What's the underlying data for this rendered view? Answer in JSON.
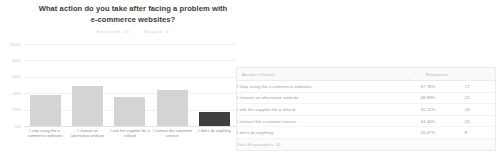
{
  "chart_data": {
    "type": "bar",
    "title": "What action do you take after facing a problem with e-commerce websites?",
    "subtitle": {
      "answered_label": "Answered: 45",
      "skipped_label": "Skipped: 0"
    },
    "xlabel": "",
    "ylabel": "",
    "ylim": [
      0,
      100
    ],
    "grid": true,
    "legend": "none",
    "ytick_labels": [
      "100%",
      "80%",
      "60%",
      "40%",
      "20%",
      "0%"
    ],
    "ytick_values": [
      100,
      80,
      60,
      40,
      20,
      0
    ],
    "categories": [
      "I stop using the e-commerce websites",
      "I choose an alternative website",
      "I ask the supplier for a refund",
      "I contact the customer service",
      "I don't do anything"
    ],
    "values": [
      37.78,
      48.89,
      35.22,
      44.44,
      16.67
    ],
    "bar_colors": [
      "#d4d4d4",
      "#d4d4d4",
      "#d4d4d4",
      "#d4d4d4",
      "#3f3f3f"
    ],
    "highlighted_index": 4
  },
  "table": {
    "headers": {
      "choice": "Answer Choices",
      "percent": "Responses",
      "count": ""
    },
    "sort_icon": "chevron-down-icon",
    "rows": [
      {
        "choice": "I stop using the e-commerce websites",
        "percent": "37.78%",
        "count": "17"
      },
      {
        "choice": "I choose an alternative website",
        "percent": "48.89%",
        "count": "22"
      },
      {
        "choice": "I ask the supplier for a refund",
        "percent": "35.22%",
        "count": "16"
      },
      {
        "choice": "I contact the customer service",
        "percent": "44.44%",
        "count": "20"
      },
      {
        "choice": "I don't do anything",
        "percent": "16.67%",
        "count": "8"
      }
    ],
    "footer": "Total Respondents: 45"
  },
  "colors": {
    "bar_default": "#d4d4d4",
    "bar_highlight": "#3f3f3f",
    "grid": "#f0f0f0",
    "text_muted": "#9a9a9a",
    "title": "#3d3d3d"
  }
}
